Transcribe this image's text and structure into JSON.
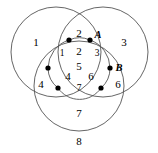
{
  "figure": {
    "kind": "venn-diagram",
    "width": 158,
    "height": 153,
    "background_color": "#ffffff",
    "stroke_color": "#555555",
    "dot_color": "#000000",
    "label_color": "#000000"
  },
  "circles": [
    {
      "name": "left-circle",
      "cx": 56,
      "cy": 52,
      "r": 45
    },
    {
      "name": "right-circle",
      "cx": 103,
      "cy": 52,
      "r": 45
    },
    {
      "name": "bottom-circle",
      "cx": 79,
      "cy": 86,
      "r": 45
    }
  ],
  "inner_arcs": [
    {
      "name": "inner-arc-top",
      "from": "dot-top-left",
      "to": "dot-top-right"
    },
    {
      "name": "inner-arc-left",
      "from": "dot-mid-left",
      "to": "dot-bottom-left"
    },
    {
      "name": "inner-arc-right",
      "from": "dot-mid-right",
      "to": "dot-bottom-right"
    },
    {
      "name": "inner-arc-bottom",
      "from": "dot-bottom-left",
      "to": "dot-bottom-right"
    }
  ],
  "dots": [
    {
      "name": "dot-top-left",
      "cx": 69,
      "cy": 40,
      "r": 2.6
    },
    {
      "name": "dot-top-right",
      "cx": 90,
      "cy": 40,
      "r": 2.6
    },
    {
      "name": "dot-mid-left",
      "cx": 48,
      "cy": 68,
      "r": 2.6
    },
    {
      "name": "dot-mid-right",
      "cx": 110,
      "cy": 68,
      "r": 2.6
    },
    {
      "name": "dot-bottom-left",
      "cx": 58,
      "cy": 88,
      "r": 2.6
    },
    {
      "name": "dot-bottom-right",
      "cx": 101,
      "cy": 88,
      "r": 2.6
    }
  ],
  "region_labels": [
    {
      "name": "region-1-outer",
      "text": "1",
      "x": 36,
      "y": 42,
      "size": "normal"
    },
    {
      "name": "region-2-top",
      "text": "2",
      "x": 79,
      "y": 33,
      "size": "normal"
    },
    {
      "name": "region-3-outer",
      "text": "3",
      "x": 124,
      "y": 42,
      "size": "normal"
    },
    {
      "name": "region-1-inner",
      "text": "1",
      "x": 62,
      "y": 54,
      "size": "small"
    },
    {
      "name": "region-2-inner",
      "text": "2",
      "x": 79,
      "y": 51,
      "size": "normal"
    },
    {
      "name": "region-3-inner",
      "text": "3",
      "x": 97,
      "y": 54,
      "size": "small"
    },
    {
      "name": "region-4-outer",
      "text": "4",
      "x": 41,
      "y": 84,
      "size": "normal"
    },
    {
      "name": "region-4-inner",
      "text": "4",
      "x": 68,
      "y": 76,
      "size": "normal"
    },
    {
      "name": "region-5-center",
      "text": "5",
      "x": 79,
      "y": 66,
      "size": "normal"
    },
    {
      "name": "region-6-inner",
      "text": "6",
      "x": 91,
      "y": 76,
      "size": "normal"
    },
    {
      "name": "region-6-outer",
      "text": "6",
      "x": 118,
      "y": 84,
      "size": "normal"
    },
    {
      "name": "region-7-inner",
      "text": "7",
      "x": 79,
      "y": 89,
      "size": "small"
    },
    {
      "name": "region-7-bottom",
      "text": "7",
      "x": 79,
      "y": 113,
      "size": "normal"
    },
    {
      "name": "region-8-outer",
      "text": "8",
      "x": 79,
      "y": 141,
      "size": "normal"
    }
  ],
  "point_labels": [
    {
      "name": "point-label-a",
      "text": "A",
      "x": 98,
      "y": 35
    },
    {
      "name": "point-label-b",
      "text": "B",
      "x": 119,
      "y": 68
    }
  ]
}
